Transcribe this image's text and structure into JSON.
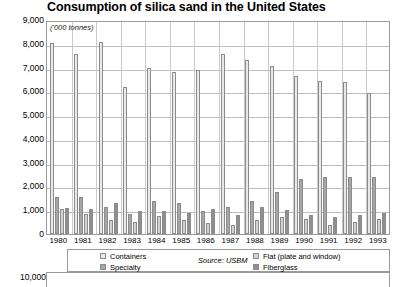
{
  "chart_data": {
    "type": "bar",
    "title": "Consumption of silica sand in the United States",
    "subtitle": "('000 tonnes)",
    "xlabel": "",
    "ylabel": "",
    "ylim": [
      0,
      9000
    ],
    "ytick_step": 1000,
    "grid": true,
    "legend_position": "bottom",
    "source": "Source: USBM",
    "yticks": [
      "9,000",
      "8,000",
      "7,000",
      "6,000",
      "5,000",
      "4,000",
      "3,000",
      "2,000",
      "1,000",
      "0"
    ],
    "categories": [
      "1980",
      "1981",
      "1982",
      "1983",
      "1984",
      "1985",
      "1986",
      "1987",
      "1988",
      "1989",
      "1990",
      "1991",
      "1992",
      "1993"
    ],
    "series": [
      {
        "name": "Containers",
        "color": "#e8e8e8",
        "values": [
          8050,
          7550,
          8080,
          6200,
          7000,
          6800,
          6900,
          7550,
          7300,
          7050,
          6650,
          6450,
          6400,
          5950
        ]
      },
      {
        "name": "Specialty",
        "color": "#a6a6a6",
        "values": [
          1550,
          1550,
          1150,
          850,
          1400,
          1300,
          950,
          1150,
          1400,
          1750,
          2300,
          2400,
          2400,
          2400
        ]
      },
      {
        "name": "Flat (plate and window)",
        "color": "#d2d2d2",
        "values": [
          1050,
          850,
          600,
          500,
          750,
          600,
          480,
          400,
          580,
          700,
          620,
          380,
          520,
          620
        ]
      },
      {
        "name": "Fiberglass",
        "color": "#8f8f8f",
        "values": [
          1100,
          1050,
          1300,
          950,
          950,
          900,
          1050,
          800,
          1150,
          1000,
          780,
          700,
          800,
          900
        ]
      }
    ]
  },
  "next_chart": {
    "first_ytick": "10,000"
  }
}
